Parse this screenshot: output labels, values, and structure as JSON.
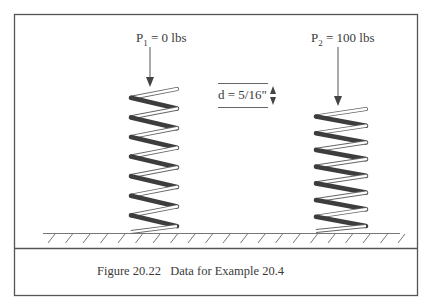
{
  "figure": {
    "load_1": {
      "symbol": "P",
      "subscript": "1",
      "value": "= 0 lbs"
    },
    "load_2": {
      "symbol": "P",
      "subscript": "2",
      "value": "= 100 lbs"
    },
    "wire_diameter": {
      "label": "d = 5/16\""
    },
    "springs": [
      {
        "name": "unloaded-spring",
        "coils": 7
      },
      {
        "name": "loaded-spring",
        "coils": 7
      }
    ]
  },
  "caption": {
    "number": "Figure 20.22",
    "text": "Data for Example 20.4"
  }
}
